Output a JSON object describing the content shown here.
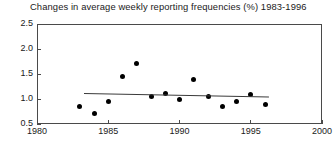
{
  "chart_data": {
    "type": "scatter",
    "title": "Changes in average weekly reporting frequencies (%) 1983-1996",
    "xlabel": "",
    "ylabel": "",
    "xlim": [
      1980,
      2000
    ],
    "ylim": [
      0.5,
      2.5
    ],
    "xticks": [
      1980,
      1985,
      1990,
      1995,
      2000
    ],
    "xtick_labels": [
      "1980",
      "1985",
      "1990",
      "1995",
      "2000"
    ],
    "yticks": [
      0.5,
      1.0,
      1.5,
      2.0,
      2.5
    ],
    "ytick_labels": [
      "0.5",
      "1.0",
      "1.5",
      "2.0",
      "2.5"
    ],
    "grid": false,
    "legend": null,
    "marker": "filled-circle",
    "marker_color": "#000000",
    "x": [
      1983,
      1984,
      1985,
      1986,
      1987,
      1988,
      1989,
      1990,
      1991,
      1992,
      1993,
      1994,
      1995,
      1996
    ],
    "values": [
      0.85,
      0.72,
      0.95,
      1.45,
      1.72,
      1.05,
      1.12,
      1.0,
      1.4,
      1.05,
      0.85,
      0.95,
      1.1,
      0.9
    ],
    "series": [
      {
        "name": "Average weekly reporting frequency change",
        "values": [
          0.85,
          0.72,
          0.95,
          1.45,
          1.72,
          1.05,
          1.12,
          1.0,
          1.4,
          1.05,
          0.85,
          0.95,
          1.1,
          0.9
        ]
      }
    ],
    "trendline": {
      "type": "linear-fit",
      "color": "#3a3a3a",
      "x_start": 1983.3,
      "x_end": 1996.3,
      "y_start": 1.12,
      "y_end": 1.05
    }
  }
}
